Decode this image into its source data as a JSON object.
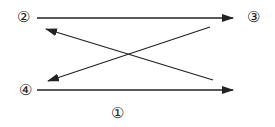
{
  "labels": {
    "n1": "①",
    "n2": "②",
    "n3": "③",
    "n4": "④"
  },
  "arrows": [
    {
      "from": "②",
      "to": "③",
      "direction": "left-to-right",
      "position": "top"
    },
    {
      "from": "bottom-right",
      "to": "near-②",
      "direction": "diagonal-up-left"
    },
    {
      "from": "near-③",
      "to": "near-④",
      "direction": "diagonal-down-left"
    },
    {
      "from": "④",
      "to": "right",
      "direction": "left-to-right",
      "position": "bottom"
    }
  ],
  "colors": {
    "line": "#222222",
    "background": "#ffffff"
  }
}
